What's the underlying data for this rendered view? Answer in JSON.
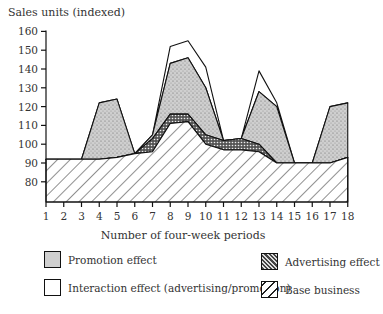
{
  "chart_data": {
    "type": "area",
    "title": "",
    "ylabel": "Sales units (indexed)",
    "xlabel": "Number of four-week periods",
    "ylim": [
      69,
      160
    ],
    "yticks": [
      80,
      90,
      100,
      110,
      120,
      130,
      140,
      150,
      160
    ],
    "x": [
      1,
      2,
      3,
      4,
      5,
      6,
      7,
      8,
      9,
      10,
      11,
      12,
      13,
      14,
      15,
      16,
      17,
      18
    ],
    "stacked": true,
    "grid": false,
    "legend_position": "bottom",
    "series": [
      {
        "name": "Base business",
        "pattern": "diagonal-hatch",
        "values": [
          92,
          92,
          92,
          92,
          93,
          95,
          96,
          111,
          112,
          100,
          97,
          97,
          96,
          90,
          90,
          90,
          90,
          93
        ]
      },
      {
        "name": "Advertising effect",
        "pattern": "crosshatch",
        "cumulative_top": [
          92,
          92,
          92,
          92,
          93,
          95,
          103,
          116,
          116,
          105,
          102,
          103,
          100,
          90,
          90,
          90,
          90,
          93
        ]
      },
      {
        "name": "Promotion effect",
        "pattern": "stipple",
        "cumulative_top": [
          92,
          92,
          92,
          122,
          124,
          95,
          105,
          143,
          146,
          130,
          102,
          103,
          128,
          120,
          90,
          90,
          120,
          122
        ]
      },
      {
        "name": "Interaction effect (advertising/promotion)",
        "pattern": "blank",
        "cumulative_top": [
          92,
          92,
          92,
          122,
          124,
          95,
          105,
          152,
          155,
          141,
          102,
          103,
          139,
          122,
          90,
          90,
          120,
          122
        ]
      }
    ]
  },
  "axis": {
    "ylabel": "Sales units (indexed)",
    "xlabel": "Number of four-week periods"
  },
  "legend": {
    "promotion": "Promotion effect",
    "interaction": "Interaction effect (advertising/promotion)",
    "advertising": "Advertising effect",
    "base": "Base business"
  }
}
